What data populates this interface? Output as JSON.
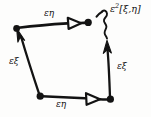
{
  "figure": {
    "kind": "hand-drawn-commutator-diagram",
    "background_color": "#fdfdfc",
    "ink_color": "#131313"
  },
  "labels": {
    "top_edge": "εη",
    "left_edge": "εξ",
    "bottom_edge": "εη",
    "right_edge": "εξ",
    "gap_annotation_base": "ε",
    "gap_annotation_exponent": "2",
    "gap_annotation_bracket": "[ξ,η]"
  },
  "diagram_data": {
    "type": "diagram",
    "vertices": [
      {
        "name": "top-left",
        "x": 16,
        "y": 28,
        "marker": "solid-dot"
      },
      {
        "name": "top-right",
        "x": 88,
        "y": 22,
        "marker": "solid-dot"
      },
      {
        "name": "bottom-left",
        "x": 40,
        "y": 96,
        "marker": "solid-dot"
      },
      {
        "name": "bottom-right",
        "x": 110,
        "y": 99,
        "marker": "solid-dot"
      }
    ],
    "edges": [
      {
        "name": "top-edge",
        "from": "top-left",
        "to": "top-right",
        "label": "εη",
        "arrowhead": "hollow-triangle",
        "direction": "right"
      },
      {
        "name": "left-edge",
        "from": "bottom-left",
        "to": "top-left",
        "label": "εξ",
        "arrowhead": "solid",
        "direction": "up-left"
      },
      {
        "name": "bottom-edge",
        "from": "bottom-left",
        "to": "bottom-right",
        "label": "εη",
        "arrowhead": "hollow-triangle",
        "direction": "right"
      },
      {
        "name": "right-edge",
        "from": "bottom-right",
        "to": "top-right",
        "label": "εξ",
        "arrowhead": "solid",
        "direction": "up"
      }
    ],
    "annotation": {
      "name": "commutator-gap",
      "text": "ε²[ξ,η]",
      "pointer": "squiggle-arrow",
      "points_to": "top-right"
    }
  }
}
